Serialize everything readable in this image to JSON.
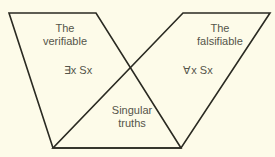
{
  "diagram": {
    "title": "",
    "regions": {
      "verifiable": {
        "title": "The\nverifiable",
        "formula": "∃x Sx"
      },
      "falsifiable": {
        "title": "The\nfalsifiable",
        "formula": "∀x Sx"
      },
      "overlap": {
        "title": "Singular\ntruths"
      }
    },
    "colors": {
      "background": "#fdfbe9",
      "line": "#2a2a22",
      "text": "#55554a"
    }
  }
}
